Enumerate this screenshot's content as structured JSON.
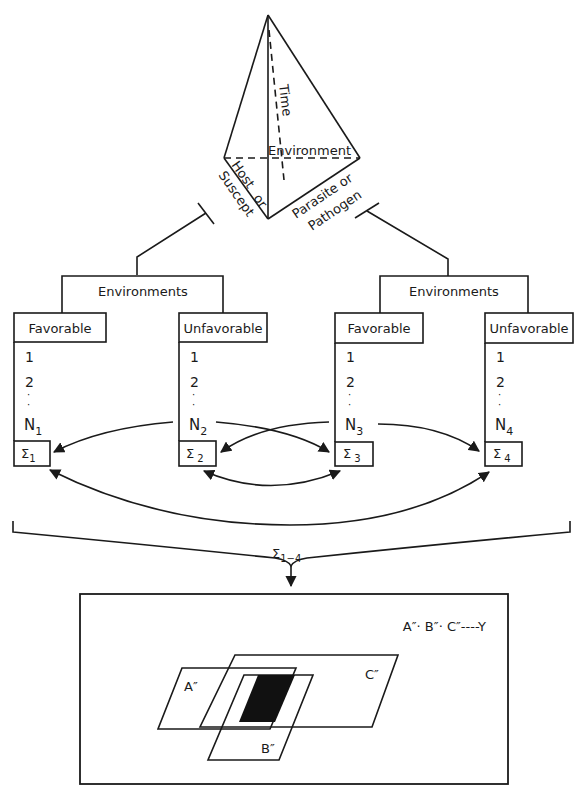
{
  "tetrahedron": {
    "time_label": "Time",
    "environment_label": "Environment",
    "host_label_line1": "Host",
    "host_label_line2": "or",
    "host_label_line3": "Suscept",
    "parasite_label_line1": "Parasite or",
    "parasite_label_line2": "Pathogen"
  },
  "groups": [
    {
      "title": "Environments",
      "columns": [
        {
          "header": "Favorable",
          "items": [
            "1",
            "2",
            "·",
            "·"
          ],
          "n_label": "N",
          "n_sub": "1",
          "sum_label": "Σ",
          "sum_sub": "1"
        },
        {
          "header": "Unfavorable",
          "items": [
            "1",
            "2",
            "·",
            "·"
          ],
          "n_label": "N",
          "n_sub": "2",
          "sum_label": "Σ",
          "sum_sub": "2"
        }
      ]
    },
    {
      "title": "Environments",
      "columns": [
        {
          "header": "Favorable",
          "items": [
            "1",
            "2",
            "·",
            "·"
          ],
          "n_label": "N",
          "n_sub": "3",
          "sum_label": "Σ",
          "sum_sub": "3"
        },
        {
          "header": "Unfavorable",
          "items": [
            "1",
            "2",
            "·",
            "·"
          ],
          "n_label": "N",
          "n_sub": "4",
          "sum_label": "Σ",
          "sum_sub": "4"
        }
      ]
    }
  ],
  "total": {
    "sum_label": "Σ",
    "sum_sub": "1−4"
  },
  "result_box": {
    "formula": "A″· B″· C″----Y",
    "set_a": "A″",
    "set_b": "B″",
    "set_c": "C″"
  },
  "colors": {
    "ink": "#1a1a1a",
    "background": "#ffffff",
    "intersection_fill": "#111111"
  }
}
